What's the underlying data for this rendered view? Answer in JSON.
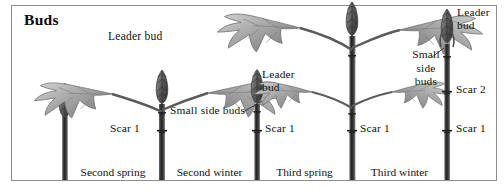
{
  "figure": {
    "title": "Buds",
    "kind": "botanical-diagram",
    "palette": {
      "background": "#ffffff",
      "border": "#8d8d8d",
      "ink": "#111111",
      "stem_dark": "#2c2c2c",
      "stem_mid": "#5a5a5a",
      "leaf_light": "#c9c9c9",
      "leaf_mid": "#a3a3a3",
      "leaf_dark": "#7a7a7a",
      "bud_dark": "#4a4a4a"
    }
  },
  "seasons": [
    {
      "label": "Second spring",
      "center_x": 113
    },
    {
      "label": "Second winter",
      "center_x": 209
    },
    {
      "label": "Third spring",
      "center_x": 304
    },
    {
      "label": "Third winter",
      "center_x": 400
    }
  ],
  "annotations": [
    {
      "id": "leader-bud-1",
      "text": "Leader bud",
      "x": 108,
      "y": 36,
      "lines": [
        "Leader bud"
      ]
    },
    {
      "id": "small-side-buds-1",
      "text": "Small side buds",
      "x": 172,
      "y": 110,
      "lines": [
        "Small side buds"
      ]
    },
    {
      "id": "leader-bud-2",
      "text": "Leader bud",
      "x": 262,
      "y": 72,
      "lines": [
        "Leader",
        "bud"
      ]
    },
    {
      "id": "leader-bud-3",
      "text": "Leader bud",
      "x": 455,
      "y": 8,
      "lines": [
        "Leader",
        "bud"
      ]
    },
    {
      "id": "small-side-buds-2",
      "text": "Small side buds",
      "x": 409,
      "y": 51,
      "lines": [
        "Small",
        "side",
        "buds"
      ]
    }
  ],
  "scars": [
    {
      "id": "scar-1-a",
      "label": "Scar 1",
      "x": 113,
      "y": 128,
      "stem": 2
    },
    {
      "id": "scar-1-b",
      "label": "Scar 1",
      "x": 265,
      "y": 128,
      "stem": 3
    },
    {
      "id": "scar-1-c",
      "label": "Scar 1",
      "x": 360,
      "y": 128,
      "stem": 4
    },
    {
      "id": "scar-2-a",
      "label": "Scar 2",
      "x": 457,
      "y": 89,
      "stem": 5
    },
    {
      "id": "scar-1-d",
      "label": "Scar 1",
      "x": 457,
      "y": 128,
      "stem": 5
    }
  ],
  "stems": [
    {
      "id": "stem-1",
      "x": 65,
      "stage": "first-winter-shoot",
      "has_leaves": false,
      "leaf_count": 0,
      "scar_count": 0
    },
    {
      "id": "stem-2",
      "x": 162,
      "stage": "second-spring",
      "has_leaves": true,
      "leaf_count": 2,
      "scar_count": 1
    },
    {
      "id": "stem-3",
      "x": 257,
      "stage": "second-winter",
      "has_leaves": false,
      "leaf_count": 0,
      "scar_count": 1
    },
    {
      "id": "stem-4",
      "x": 352,
      "stage": "third-spring",
      "has_leaves": true,
      "leaf_count": 4,
      "scar_count": 1
    },
    {
      "id": "stem-5",
      "x": 447,
      "stage": "third-winter",
      "has_leaves": false,
      "leaf_count": 0,
      "scar_count": 2
    }
  ]
}
